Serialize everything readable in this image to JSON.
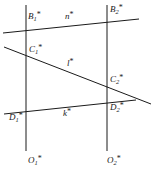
{
  "figure": {
    "kind": "geometric-diagram",
    "width": 160,
    "height": 175,
    "background_color": "#ffffff",
    "stroke_color": "#1a1a1a",
    "lines": [
      {
        "id": "vertical-left",
        "name": "left-vertical-line",
        "x1": 26,
        "y1": 5,
        "x2": 26,
        "y2": 151
      },
      {
        "id": "vertical-right",
        "name": "right-vertical-line",
        "x1": 107,
        "y1": 5,
        "x2": 107,
        "y2": 151
      },
      {
        "id": "line-n",
        "name": "line-n-star",
        "x1": 3,
        "y1": 33,
        "x2": 139,
        "y2": 19
      },
      {
        "id": "line-l",
        "name": "line-l-star",
        "x1": 4,
        "y1": 47,
        "x2": 151,
        "y2": 104
      },
      {
        "id": "line-k",
        "name": "line-k-star",
        "x1": 4,
        "y1": 114,
        "x2": 136,
        "y2": 100
      }
    ],
    "line_labels": [
      {
        "id": "label-n",
        "base": "n",
        "star": "*",
        "x": 65,
        "y": 11
      },
      {
        "id": "label-l",
        "base": "l",
        "star": "*",
        "x": 67,
        "y": 58
      },
      {
        "id": "label-k",
        "base": "k",
        "star": "*",
        "x": 63,
        "y": 108
      }
    ],
    "point_labels": [
      {
        "id": "label-B1",
        "base": "B",
        "sub": "1",
        "star": "*",
        "x": 28,
        "y": 11
      },
      {
        "id": "label-B2",
        "base": "B",
        "sub": "2",
        "star": "*",
        "x": 110,
        "y": 4
      },
      {
        "id": "label-C1",
        "base": "C",
        "sub": "1",
        "star": "*",
        "x": 29,
        "y": 44
      },
      {
        "id": "label-C2",
        "base": "C",
        "sub": "2",
        "star": "*",
        "x": 110,
        "y": 74
      },
      {
        "id": "label-D1",
        "base": "D",
        "sub": "1",
        "star": "*",
        "x": 9,
        "y": 112
      },
      {
        "id": "label-D2",
        "base": "D",
        "sub": "2",
        "star": "*",
        "x": 110,
        "y": 102
      },
      {
        "id": "label-O1",
        "base": "O",
        "sub": "1",
        "star": "*",
        "x": 28,
        "y": 155
      },
      {
        "id": "label-O2",
        "base": "O",
        "sub": "2",
        "star": "*",
        "x": 107,
        "y": 155
      }
    ]
  }
}
